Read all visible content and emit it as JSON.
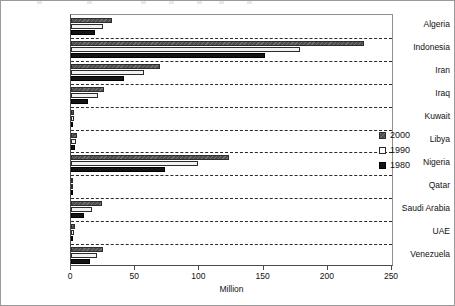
{
  "chart_data": {
    "type": "bar",
    "orientation": "horizontal",
    "title": "",
    "xlabel": "Million",
    "ylabel": "",
    "xlim": [
      0,
      250
    ],
    "xticks": [
      0,
      50,
      100,
      150,
      200,
      250
    ],
    "grid": "dashed separators between categories",
    "legend_position": "right",
    "categories": [
      "Algeria",
      "Indonesia",
      "Iran",
      "Iraq",
      "Kuwait",
      "Libya",
      "Nigeria",
      "Qatar",
      "Saudi Arabia",
      "UAE",
      "Venezuela"
    ],
    "series": [
      {
        "name": "2000",
        "color": "#4f4f4f",
        "values": [
          32,
          228,
          69,
          26,
          2,
          5,
          123,
          0.6,
          24,
          3,
          25
        ]
      },
      {
        "name": "1990",
        "color": "#f2f2f2",
        "values": [
          25,
          178,
          57,
          21,
          2,
          4,
          99,
          0.5,
          16,
          2,
          20
        ]
      },
      {
        "name": "1980",
        "color": "#141414",
        "values": [
          19,
          151,
          41,
          13,
          1,
          3,
          73,
          0.2,
          10,
          1,
          15
        ]
      }
    ]
  },
  "legend": {
    "entries": [
      {
        "label": "2000",
        "swatch": "dark-gray-hatched-swatch"
      },
      {
        "label": "1990",
        "swatch": "white-outlined-swatch"
      },
      {
        "label": "1980",
        "swatch": "black-swatch"
      }
    ]
  },
  "axis": {
    "x_title": "Million",
    "x_tick_labels": [
      "0",
      "50",
      "100",
      "150",
      "200",
      "250"
    ]
  }
}
